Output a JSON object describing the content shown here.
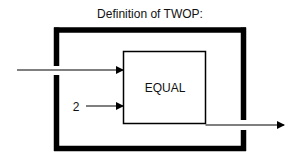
{
  "diagram": {
    "title": "Definition of TWOP:",
    "inner_block": {
      "label": "EQUAL"
    },
    "inputs": [
      {
        "id": "input-1",
        "label": ""
      },
      {
        "id": "input-2",
        "label": "2"
      }
    ],
    "outputs": [
      {
        "id": "output-1",
        "label": ""
      }
    ],
    "colors": {
      "stroke": "#000000",
      "background": "#ffffff",
      "text": "#111111"
    }
  }
}
